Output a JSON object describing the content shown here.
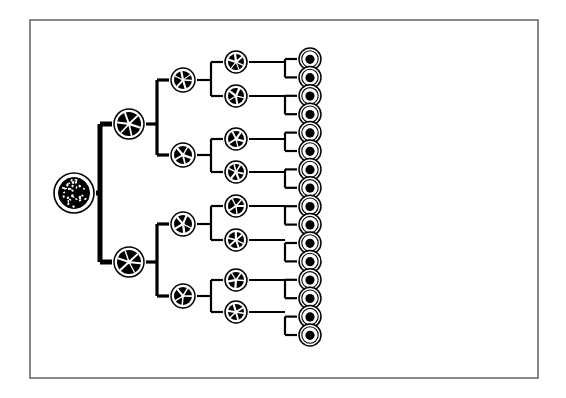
{
  "figure": {
    "kind": "cell-lineage-diagram",
    "frame": {
      "x": 30,
      "y": 20,
      "width": 508,
      "height": 358,
      "stroke": "#555555"
    },
    "background": "#ffffff",
    "ink": "#000000"
  },
  "labels": {
    "e1": "E₁",
    "e2": "E₂",
    "e3": "E₃",
    "e4": "E₄",
    "e5": "E₅",
    "rtc": "Rtc"
  },
  "axis": {
    "name": "time-axis",
    "unit_label": "hours",
    "break_label": "3days",
    "y": 348,
    "x_start": 62,
    "x_end": 522,
    "ticks": [
      {
        "x": 62,
        "label": ""
      },
      {
        "x": 124,
        "label": "20"
      },
      {
        "x": 186,
        "label": "20"
      },
      {
        "x": 248,
        "label": "20"
      },
      {
        "x": 310,
        "label": "25"
      },
      {
        "x": 382,
        "label": "30"
      },
      {
        "x": 432,
        "label": ""
      },
      {
        "x": 470,
        "label": ""
      },
      {
        "x": 522,
        "label": ""
      }
    ],
    "tick_label_positions": [
      {
        "x": 80,
        "text": "hours"
      },
      {
        "x": 120,
        "text": "20"
      },
      {
        "x": 182,
        "text": "20"
      },
      {
        "x": 244,
        "text": "20"
      },
      {
        "x": 306,
        "text": "25"
      },
      {
        "x": 375,
        "text": "30"
      },
      {
        "x": 452,
        "text": "3days"
      }
    ],
    "break_x": 437
  },
  "generations": [
    {
      "id": "E1",
      "name": "generation-e1",
      "cell_x": 74,
      "cell_r": 20,
      "style": "yolk-granular",
      "cells": [
        {
          "cy": 193
        }
      ]
    },
    {
      "id": "E2",
      "name": "generation-e2",
      "cell_x": 129,
      "cell_r": 15,
      "style": "dark-rosette",
      "cells": [
        {
          "cy": 124
        },
        {
          "cy": 262
        }
      ]
    },
    {
      "id": "E3",
      "name": "generation-e3",
      "cell_x": 183,
      "cell_r": 12,
      "style": "dark-rosette",
      "cells": [
        {
          "cy": 80
        },
        {
          "cy": 155
        },
        {
          "cy": 224
        },
        {
          "cy": 296
        }
      ]
    },
    {
      "id": "E4",
      "name": "generation-e4",
      "cell_x": 236,
      "cell_r": 11,
      "style": "dark-rosette",
      "cells": [
        {
          "cy": 62
        },
        {
          "cy": 96
        },
        {
          "cy": 139
        },
        {
          "cy": 172
        },
        {
          "cy": 206
        },
        {
          "cy": 240
        },
        {
          "cy": 280
        },
        {
          "cy": 312
        }
      ]
    },
    {
      "id": "E5",
      "name": "generation-e5",
      "cell_x": 310,
      "cell_r": 11,
      "style": "nucleated-circle",
      "count": 16,
      "first_cy": 59,
      "spacing": 18.4
    }
  ],
  "columns": {
    "blobs": {
      "name": "blob-column",
      "x": 388,
      "count": 16,
      "first_cy": 59,
      "spacing": 18.4,
      "description": "irregular amoeboid cells with dark nuclei"
    },
    "filament": {
      "name": "filament-column",
      "x": 433,
      "top": 45,
      "bottom": 335,
      "description": "vertical syncytial strand with dark nuclei and lateral lobes",
      "nuclei": [
        {
          "cy": 140
        },
        {
          "cy": 248
        }
      ]
    },
    "rtc": {
      "name": "rtc-column",
      "x": 470,
      "count": 16,
      "first_cy": 59,
      "spacing": 18.4,
      "description": "irregular outlined round cells"
    },
    "final": {
      "name": "final-circle-column",
      "x": 516,
      "count": 16,
      "first_cy": 59,
      "spacing": 18.4,
      "description": "plain empty circles"
    }
  },
  "connectors": {
    "trunk_width": 5,
    "branch_width": 2.2,
    "dash_pattern": "4 4",
    "dashed_links": {
      "from_x": 322,
      "to_x": 374,
      "count": 16
    }
  }
}
